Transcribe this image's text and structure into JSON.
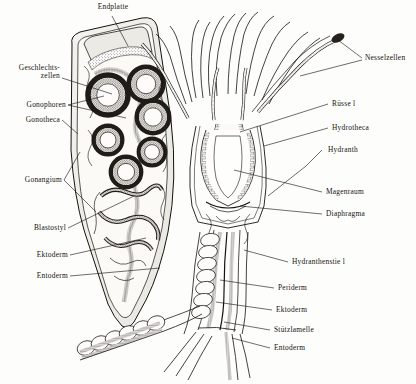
{
  "figure": {
    "language": "de",
    "background_color": "#fdfdfb",
    "ink_color": "#16130f",
    "width": 416,
    "height": 384
  },
  "labels": {
    "endplatte": "Endplatte",
    "geschlechtszellen_line1": "Geschlechts-",
    "geschlechtszellen_line2": "zellen",
    "gonophoren": "Gonophoren",
    "gonotheca": "Gonotheca",
    "gonangium": "Gonangium",
    "blastostyl": "Blastostyl",
    "ektoderm_left": "Ektoderm",
    "entoderm_left": "Entoderm",
    "nesselzellen": "Nesselzellen",
    "ruessel": "Rüsse l",
    "hydrotheca": "Hydrotheca",
    "hydranth": "Hydranth",
    "magenraum": "Magenraum",
    "diaphragma": "Diaphragma",
    "hydranthenstiel": "Hydranthenstie l",
    "periderm": "Periderm",
    "ektoderm_right": "Ektoderm",
    "stuetzlamelle": "Stützlamelle",
    "entoderm_right": "Entoderm"
  },
  "structures": {
    "gonangium": "elongated club-shaped capsule, left side, containing stacked ring-shaped gonophores",
    "gonophore_count": 6,
    "hydranth": "polyp head with radiating tentacles, right side",
    "tentacle_count": 12,
    "stolon": "horizontal creeping root stem at lower left",
    "stem": "vertical perisarc-sheathed stalk descending to base"
  },
  "tissue_layers": {
    "ektoderm": "outer cell layer, stippled",
    "stuetzlamelle": "supporting lamella between layers",
    "entoderm": "inner cell layer, hatched",
    "periderm": "external chitinous sheath"
  }
}
